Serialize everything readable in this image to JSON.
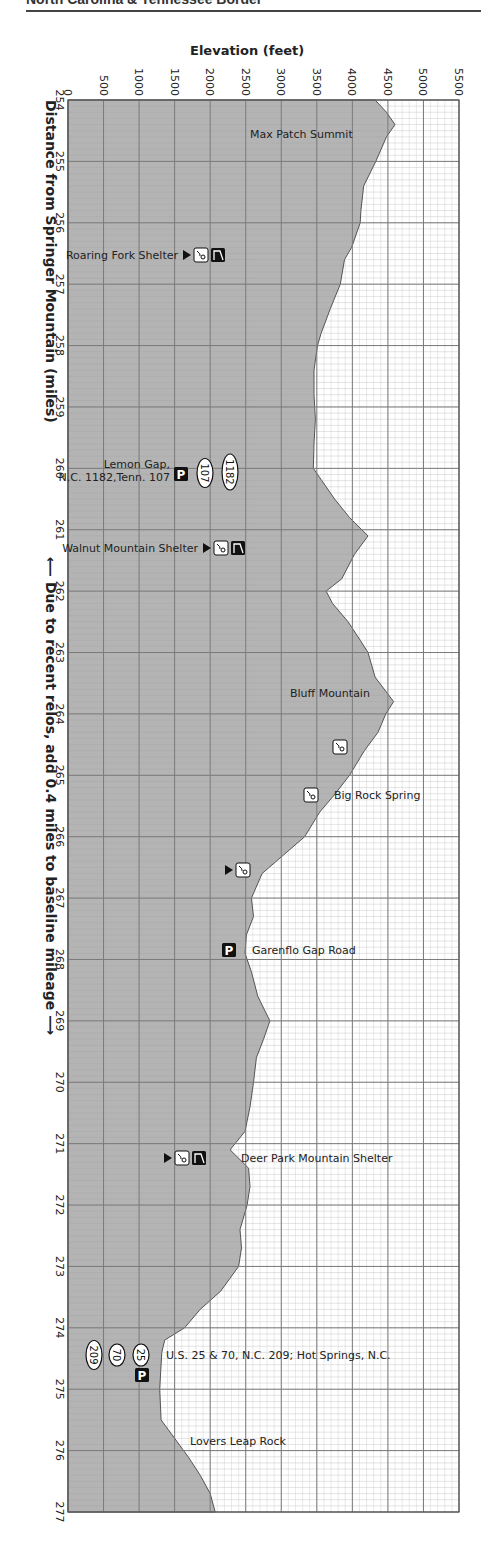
{
  "page": {
    "header": "North Carolina & Tennessee Border"
  },
  "chart_data": {
    "type": "area",
    "xlabel": "Distance from Springer Mountain (miles)",
    "ylabel": "Elevation (feet)",
    "orientation": "vertical (distance runs top to bottom, elevation left to right)",
    "xlim": [
      254,
      277
    ],
    "ylim": [
      0,
      5500
    ],
    "x_ticks": [
      254,
      255,
      256,
      257,
      258,
      259,
      260,
      261,
      262,
      263,
      264,
      265,
      266,
      267,
      268,
      269,
      270,
      271,
      272,
      273,
      274,
      275,
      276,
      277
    ],
    "y_ticks": [
      0,
      500,
      1000,
      1500,
      2000,
      2500,
      3000,
      3500,
      4000,
      4500,
      5000,
      5500
    ],
    "grid": true,
    "note": "Due to recent relos, add 0.4 miles to baseline mileage",
    "profile": [
      [
        254.0,
        4320
      ],
      [
        254.2,
        4480
      ],
      [
        254.4,
        4600
      ],
      [
        254.6,
        4480
      ],
      [
        255.0,
        4330
      ],
      [
        255.4,
        4160
      ],
      [
        255.8,
        4120
      ],
      [
        256.0,
        4110
      ],
      [
        256.4,
        3990
      ],
      [
        256.6,
        3890
      ],
      [
        257.0,
        3830
      ],
      [
        257.4,
        3690
      ],
      [
        257.8,
        3560
      ],
      [
        258.0,
        3510
      ],
      [
        258.4,
        3460
      ],
      [
        258.8,
        3460
      ],
      [
        259.2,
        3480
      ],
      [
        259.6,
        3460
      ],
      [
        260.0,
        3450
      ],
      [
        260.2,
        3570
      ],
      [
        260.5,
        3750
      ],
      [
        260.8,
        3960
      ],
      [
        261.1,
        4220
      ],
      [
        261.4,
        4030
      ],
      [
        261.8,
        3850
      ],
      [
        262.0,
        3630
      ],
      [
        262.2,
        3720
      ],
      [
        262.5,
        3940
      ],
      [
        262.8,
        4110
      ],
      [
        263.0,
        4220
      ],
      [
        263.4,
        4320
      ],
      [
        263.8,
        4580
      ],
      [
        264.0,
        4470
      ],
      [
        264.3,
        4360
      ],
      [
        264.6,
        4170
      ],
      [
        265.0,
        3960
      ],
      [
        265.3,
        3760
      ],
      [
        265.6,
        3540
      ],
      [
        266.0,
        3330
      ],
      [
        266.3,
        3030
      ],
      [
        266.6,
        2730
      ],
      [
        267.0,
        2580
      ],
      [
        267.3,
        2610
      ],
      [
        267.6,
        2510
      ],
      [
        267.9,
        2490
      ],
      [
        268.2,
        2580
      ],
      [
        268.6,
        2670
      ],
      [
        269.0,
        2840
      ],
      [
        269.3,
        2750
      ],
      [
        269.6,
        2650
      ],
      [
        270.0,
        2610
      ],
      [
        270.4,
        2560
      ],
      [
        270.8,
        2490
      ],
      [
        271.1,
        2280
      ],
      [
        271.4,
        2540
      ],
      [
        271.7,
        2560
      ],
      [
        272.0,
        2520
      ],
      [
        272.4,
        2420
      ],
      [
        272.7,
        2440
      ],
      [
        273.0,
        2400
      ],
      [
        273.4,
        2150
      ],
      [
        273.7,
        1860
      ],
      [
        274.0,
        1640
      ],
      [
        274.2,
        1360
      ],
      [
        274.4,
        1320
      ],
      [
        275.0,
        1290
      ],
      [
        275.5,
        1310
      ],
      [
        275.8,
        1500
      ],
      [
        276.1,
        1690
      ],
      [
        276.4,
        1860
      ],
      [
        276.7,
        2000
      ],
      [
        277.0,
        2070
      ]
    ],
    "annotations": [
      {
        "mile": 254.45,
        "elevation": 4550,
        "label": "Max Patch Summit",
        "icons": []
      },
      {
        "mile": 256.6,
        "elevation": 3900,
        "label": "Roaring Fork Shelter",
        "icons": [
          "campsite",
          "water",
          "shelter"
        ]
      },
      {
        "mile": 260.0,
        "elevation": 3450,
        "label": "Lemon Gap, N.C. 1182,Tenn. 107",
        "icons": [
          "parking",
          "route-107",
          "route-1182"
        ]
      },
      {
        "mile": 261.3,
        "elevation": 4100,
        "label": "Walnut Mountain Shelter",
        "icons": [
          "campsite",
          "water",
          "shelter"
        ]
      },
      {
        "mile": 263.8,
        "elevation": 4580,
        "label": "Bluff Mountain",
        "icons": []
      },
      {
        "mile": 264.6,
        "elevation": 4170,
        "label": "",
        "icons": [
          "water"
        ]
      },
      {
        "mile": 265.3,
        "elevation": 3760,
        "label": "Big Rock Spring",
        "icons": [
          "water"
        ]
      },
      {
        "mile": 266.6,
        "elevation": 2730,
        "label": "",
        "icons": [
          "campsite",
          "water"
        ]
      },
      {
        "mile": 267.8,
        "elevation": 2490,
        "label": "Garenflo Gap Road",
        "icons": [
          "parking"
        ]
      },
      {
        "mile": 271.2,
        "elevation": 2280,
        "label": "Deer Park Mountain Shelter",
        "icons": [
          "campsite",
          "water",
          "shelter"
        ]
      },
      {
        "mile": 274.3,
        "elevation": 1340,
        "label": "U.S. 25 & 70, N.C. 209; Hot Springs, N.C.",
        "icons": [
          "route-209",
          "route-70",
          "route-25",
          "parking"
        ]
      },
      {
        "mile": 275.9,
        "elevation": 1560,
        "label": "Lovers Leap Rock",
        "icons": []
      }
    ]
  },
  "labels": {
    "elevation_title": "Elevation (feet)",
    "distance_title": "Distance from Springer Mountain (miles)",
    "relo_note": "Due to recent relos, add 0.4 miles to baseline mileage",
    "arrow_up": "⟵",
    "arrow_down": "⟶"
  },
  "style": {
    "fill_color": "#b4b4b4",
    "grid_major_color": "#7a7a7a",
    "grid_minor_color": "#c8c8c8",
    "background": "#ffffff",
    "edge_color": "#555555"
  }
}
